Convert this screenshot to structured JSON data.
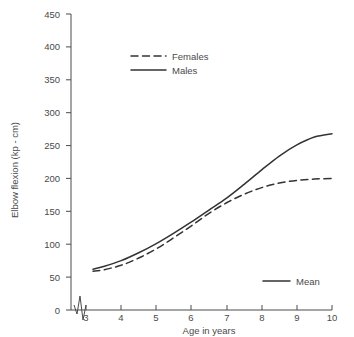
{
  "chart_data": {
    "type": "line",
    "title": "",
    "xlabel": "Age in years",
    "ylabel": "Elbow flexion (kp - cm)",
    "xlim": [
      3,
      10
    ],
    "ylim": [
      0,
      450
    ],
    "xticks": [
      3,
      4,
      5,
      6,
      7,
      8,
      9,
      10
    ],
    "yticks": [
      0,
      50,
      100,
      150,
      200,
      250,
      300,
      350,
      400,
      450
    ],
    "xtick_labels": [
      "3",
      "4",
      "5",
      "6",
      "7",
      "8",
      "9",
      "10"
    ],
    "ytick_labels": [
      "0",
      "50",
      "100",
      "150",
      "200",
      "250",
      "300",
      "350",
      "400",
      "450"
    ],
    "grid": false,
    "axis_break": "y-axis broken between 0 and first data region",
    "legend_position": "upper-left",
    "x": [
      3.2,
      3.5,
      4,
      4.5,
      5,
      5.5,
      6,
      6.5,
      7,
      7.5,
      8,
      8.5,
      9,
      9.5,
      10
    ],
    "series": [
      {
        "name": "Females",
        "style": "dashed",
        "color": "#333333",
        "values": [
          59,
          61,
          68,
          79,
          93,
          110,
          128,
          147,
          163,
          176,
          186,
          193,
          197,
          199,
          200
        ]
      },
      {
        "name": "Males",
        "style": "solid",
        "color": "#333333",
        "values": [
          62,
          66,
          75,
          87,
          101,
          117,
          134,
          152,
          170,
          191,
          213,
          234,
          251,
          263,
          268
        ]
      }
    ],
    "annotations": [
      {
        "label": "Mean",
        "style": "solid-line-swatch",
        "position": "lower-right"
      }
    ]
  },
  "legend": {
    "items": [
      {
        "label": "Females",
        "style": "dashed"
      },
      {
        "label": "Males",
        "style": "solid"
      }
    ]
  },
  "mean_note": {
    "label": "Mean"
  }
}
